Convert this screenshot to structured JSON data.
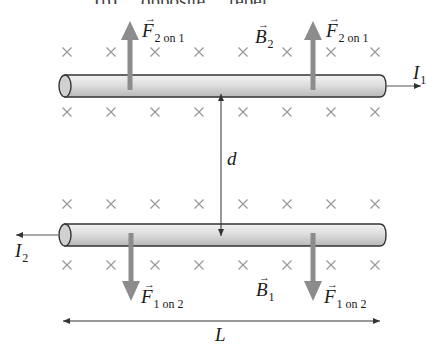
{
  "figure": {
    "top_caption_cutoff": "(b) ... opposite ... repel",
    "wires": [
      {
        "id": "wire-1",
        "current_label": "I",
        "current_subscript": "1",
        "current_direction": "right",
        "y_top": 75,
        "y_bottom": 97,
        "x_left": 58,
        "x_right": 385
      },
      {
        "id": "wire-2",
        "current_label": "I",
        "current_subscript": "2",
        "current_direction": "left",
        "y_top": 224,
        "y_bottom": 246,
        "x_left": 58,
        "x_right": 385
      }
    ],
    "force_labels": {
      "f21_main": "F",
      "f21_sub": "2 on 1",
      "f12_main": "F",
      "f12_sub": "1 on 2"
    },
    "field_labels": {
      "b2_main": "B",
      "b2_sub": "2",
      "b1_main": "B",
      "b1_sub": "1"
    },
    "separation_label": "d",
    "length_label": "L",
    "vector_arrow_glyph": "→",
    "colors": {
      "wire_fill_light": "#e6e6e6",
      "wire_fill_dark": "#bdbdbd",
      "wire_outline": "#333333",
      "force_arrow": "#8c8c8c",
      "field_x": "#9a9a9a",
      "line": "#333333"
    },
    "field_x_rows_y": [
      52,
      112,
      204,
      265
    ],
    "field_x_columns_x": [
      67,
      111,
      155,
      199,
      243,
      287,
      331,
      375
    ]
  }
}
